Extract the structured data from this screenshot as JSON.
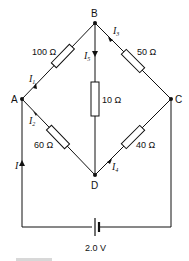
{
  "diagram": {
    "type": "circuit",
    "nodes": [
      {
        "id": "A",
        "label": "A"
      },
      {
        "id": "B",
        "label": "B"
      },
      {
        "id": "C",
        "label": "C"
      },
      {
        "id": "D",
        "label": "D"
      }
    ],
    "resistors": [
      {
        "from": "A",
        "to": "B",
        "label": "100 Ω"
      },
      {
        "from": "B",
        "to": "C",
        "label": "50 Ω"
      },
      {
        "from": "B",
        "to": "D",
        "label": "10 Ω"
      },
      {
        "from": "A",
        "to": "D",
        "label": "60 Ω"
      },
      {
        "from": "D",
        "to": "C",
        "label": "40 Ω"
      }
    ],
    "currents": [
      {
        "name": "I",
        "sub": "1",
        "branch": "A-B"
      },
      {
        "name": "I",
        "sub": "2",
        "branch": "A-D"
      },
      {
        "name": "I",
        "sub": "3",
        "branch": "B-C"
      },
      {
        "name": "I",
        "sub": "4",
        "branch": "D-C"
      },
      {
        "name": "I",
        "sub": "5",
        "branch": "B-D"
      },
      {
        "name": "I",
        "sub": "",
        "branch": "battery-A"
      }
    ],
    "battery": {
      "label": "2.0 V"
    }
  }
}
